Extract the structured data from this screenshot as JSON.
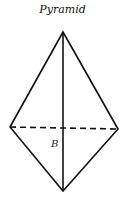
{
  "diagram": {
    "title": "Pyramid",
    "label_base": "B",
    "colors": {
      "line": "#111111",
      "background": "#ffffff"
    },
    "vertices": {
      "apex": [
        63,
        32
      ],
      "left": [
        10,
        127
      ],
      "right": [
        118,
        129
      ],
      "bottom": [
        63,
        191
      ]
    }
  }
}
